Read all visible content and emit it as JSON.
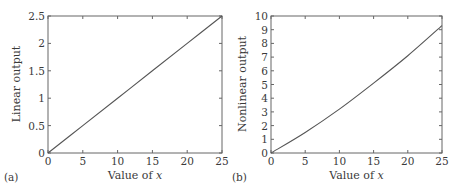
{
  "chart_data": [
    {
      "type": "line",
      "panel_label": "(a)",
      "title": "",
      "xlabel": "Value of x",
      "ylabel": "Linear output",
      "xlim": [
        0,
        25
      ],
      "ylim": [
        0,
        2.5
      ],
      "xticks": [
        "0",
        "5",
        "10",
        "15",
        "20",
        "25"
      ],
      "yticks": [
        "0",
        "0.5",
        "1",
        "1.5",
        "2",
        "2.5"
      ],
      "grid": false,
      "series": [
        {
          "name": "linear",
          "x": [
            0,
            5,
            10,
            15,
            20,
            25
          ],
          "values": [
            0,
            0.5,
            1.0,
            1.5,
            2.0,
            2.5
          ]
        }
      ]
    },
    {
      "type": "line",
      "panel_label": "(b)",
      "title": "",
      "xlabel": "Value of x",
      "ylabel": "Nonlinear output",
      "xlim": [
        0,
        25
      ],
      "ylim": [
        0,
        10
      ],
      "xticks": [
        "0",
        "5",
        "10",
        "15",
        "20",
        "25"
      ],
      "yticks": [
        "0",
        "1",
        "2",
        "3",
        "4",
        "5",
        "6",
        "7",
        "8",
        "9",
        "10"
      ],
      "grid": false,
      "series": [
        {
          "name": "nonlinear",
          "x": [
            0,
            5,
            10,
            15,
            20,
            25
          ],
          "values": [
            0,
            1.5,
            3.2,
            5.1,
            7.1,
            9.3
          ]
        }
      ]
    }
  ],
  "colors": {
    "line": "#555555",
    "axes": "#666666",
    "text": "#3a3a3a"
  }
}
